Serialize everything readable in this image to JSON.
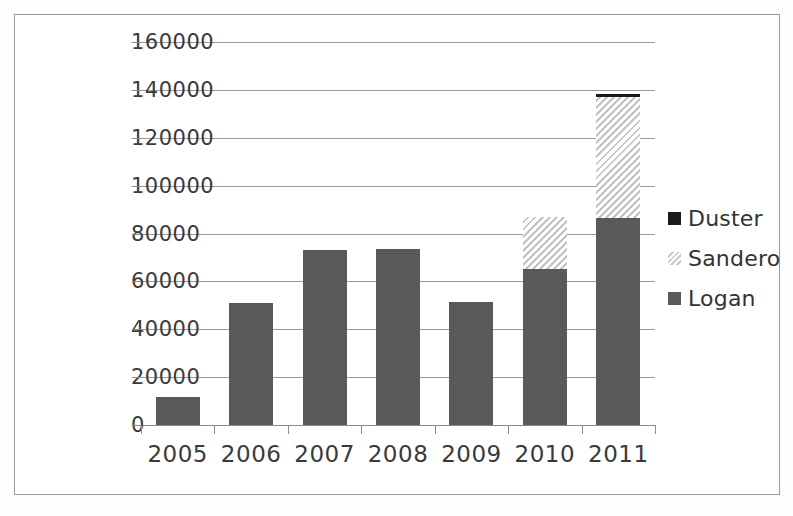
{
  "chart_data": {
    "type": "bar",
    "subtype": "stacked-column",
    "title": "",
    "xlabel": "",
    "ylabel": "",
    "categories": [
      "2005",
      "2006",
      "2007",
      "2008",
      "2009",
      "2010",
      "2011"
    ],
    "series": [
      {
        "name": "Logan",
        "color": "#595959",
        "pattern": "solid-gray",
        "values": [
          11700,
          50900,
          73200,
          73700,
          51400,
          65300,
          86500
        ]
      },
      {
        "name": "Sandero",
        "color": "#c3c3c3",
        "pattern": "diagonal-hatch",
        "values": [
          0,
          0,
          0,
          0,
          0,
          21600,
          50500
        ]
      },
      {
        "name": "Duster",
        "color": "#1b1b1b",
        "pattern": "solid-black",
        "values": [
          0,
          0,
          0,
          0,
          0,
          0,
          1400
        ]
      }
    ],
    "totals": [
      11700,
      50900,
      73200,
      73700,
      51400,
      86900,
      138400
    ],
    "ylim": [
      0,
      160000
    ],
    "ytick_values": [
      0,
      20000,
      40000,
      60000,
      80000,
      100000,
      120000,
      140000,
      160000
    ],
    "ytick_labels": [
      "0",
      "20000",
      "40000",
      "60000",
      "80000",
      "100000",
      "120000",
      "140000",
      "160000"
    ],
    "grid": true,
    "grid_axis": "y",
    "legend_position": "right",
    "legend_order": [
      "Duster",
      "Sandero",
      "Logan"
    ]
  },
  "legend": {
    "items": [
      {
        "label": "Duster",
        "swatch": "duster-swatch-icon"
      },
      {
        "label": "Sandero",
        "swatch": "sandero-swatch-icon"
      },
      {
        "label": "Logan",
        "swatch": "logan-swatch-icon"
      }
    ]
  },
  "colors": {
    "logan": "#595959",
    "sandero": "#c3c3c3",
    "duster": "#1b1b1b",
    "gridline": "#9a9a9a",
    "axis": "#8a8a8a",
    "text": "#3a3a3a",
    "page_border": "#9b9b9b",
    "background": "#ffffff"
  }
}
